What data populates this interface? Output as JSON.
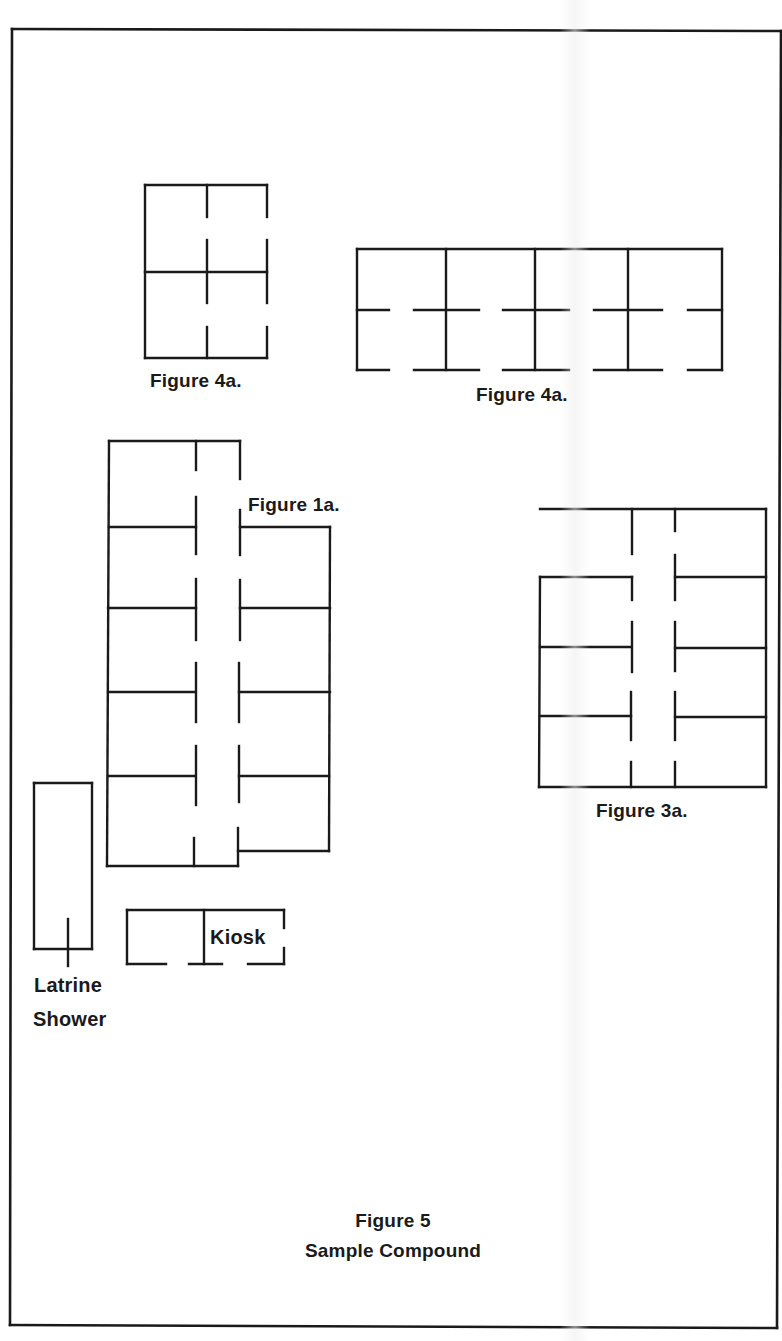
{
  "page": {
    "caption_title": "Figure 5",
    "caption_subtitle": "Sample Compound"
  },
  "colors": {
    "ink": "#1a1a1a",
    "paper": "#ffffff"
  },
  "labels": {
    "fig4a_left": "Figure 4a.",
    "fig4a_right": "Figure 4a.",
    "fig1a": "Figure 1a.",
    "fig3a": "Figure 3a.",
    "kiosk": "Kiosk",
    "latrine": "Latrine",
    "shower": "Shower"
  },
  "diagram": {
    "frame": [
      [
        12,
        29,
        781,
        31
      ],
      [
        781,
        31,
        777,
        1328
      ],
      [
        777,
        1328,
        10,
        1325
      ],
      [
        10,
        1325,
        12,
        29
      ]
    ],
    "figure_4a_left": [
      [
        145,
        185,
        267,
        185
      ],
      [
        145,
        185,
        145,
        358
      ],
      [
        145,
        358,
        267,
        358
      ],
      [
        145,
        272,
        267,
        272
      ],
      [
        207,
        185,
        207,
        217
      ],
      [
        207,
        240,
        207,
        303
      ],
      [
        207,
        327,
        207,
        358
      ],
      [
        267,
        185,
        267,
        217
      ],
      [
        267,
        240,
        267,
        303
      ],
      [
        267,
        327,
        267,
        358
      ]
    ],
    "figure_4a_right": [
      [
        357,
        249,
        722,
        249
      ],
      [
        357,
        249,
        357,
        370
      ],
      [
        722,
        249,
        722,
        370
      ],
      [
        446,
        249,
        446,
        370
      ],
      [
        535,
        249,
        535,
        370
      ],
      [
        628,
        249,
        628,
        370
      ],
      [
        357,
        310,
        389,
        310
      ],
      [
        414,
        310,
        479,
        310
      ],
      [
        503,
        310,
        569,
        310
      ],
      [
        594,
        310,
        662,
        310
      ],
      [
        688,
        310,
        722,
        310
      ],
      [
        357,
        370,
        389,
        370
      ],
      [
        414,
        370,
        479,
        370
      ],
      [
        503,
        370,
        569,
        370
      ],
      [
        594,
        370,
        662,
        370
      ],
      [
        688,
        370,
        722,
        370
      ]
    ],
    "figure_1a": [
      [
        109,
        441,
        240,
        441
      ],
      [
        109,
        441,
        107,
        866
      ],
      [
        107,
        866,
        238,
        866
      ],
      [
        196,
        441,
        196,
        470
      ],
      [
        196,
        497,
        196,
        554
      ],
      [
        196,
        579,
        196,
        640
      ],
      [
        196,
        663,
        196,
        722
      ],
      [
        196,
        746,
        196,
        805
      ],
      [
        194,
        838,
        194,
        866
      ],
      [
        240,
        441,
        240,
        479
      ],
      [
        240,
        510,
        240,
        555
      ],
      [
        240,
        580,
        240,
        640
      ],
      [
        239,
        663,
        239,
        722
      ],
      [
        239,
        746,
        239,
        802
      ],
      [
        238,
        828,
        238,
        866
      ],
      [
        109,
        527,
        196,
        527
      ],
      [
        108,
        608,
        196,
        608
      ],
      [
        108,
        692,
        195,
        692
      ],
      [
        108,
        776,
        195,
        776
      ],
      [
        240,
        527,
        330,
        527
      ],
      [
        330,
        527,
        329,
        851
      ],
      [
        238,
        851,
        329,
        851
      ],
      [
        240,
        608,
        330,
        608
      ],
      [
        239,
        692,
        330,
        692
      ],
      [
        239,
        776,
        329,
        776
      ]
    ],
    "figure_3a": [
      [
        540,
        509,
        766,
        509
      ],
      [
        766,
        509,
        766,
        787
      ],
      [
        539,
        787,
        766,
        787
      ],
      [
        540,
        577,
        632,
        577
      ],
      [
        540,
        577,
        539,
        787
      ],
      [
        632,
        509,
        632,
        554
      ],
      [
        632,
        577,
        632,
        600
      ],
      [
        632,
        622,
        632,
        672
      ],
      [
        631,
        692,
        631,
        740
      ],
      [
        631,
        762,
        631,
        787
      ],
      [
        675,
        509,
        675,
        531
      ],
      [
        675,
        555,
        675,
        600
      ],
      [
        675,
        622,
        675,
        671
      ],
      [
        675,
        692,
        675,
        740
      ],
      [
        675,
        762,
        675,
        787
      ],
      [
        540,
        647,
        631,
        647
      ],
      [
        540,
        716,
        631,
        716
      ],
      [
        675,
        577,
        766,
        577
      ],
      [
        675,
        648,
        766,
        648
      ],
      [
        675,
        717,
        766,
        717
      ]
    ],
    "latrine": [
      [
        34,
        783,
        92,
        783
      ],
      [
        92,
        783,
        92,
        949
      ],
      [
        92,
        949,
        34,
        949
      ],
      [
        34,
        949,
        34,
        783
      ],
      [
        68,
        919,
        68,
        966
      ]
    ],
    "kiosk": [
      [
        127,
        910,
        284,
        910
      ],
      [
        127,
        910,
        127,
        964
      ],
      [
        204,
        910,
        204,
        964
      ],
      [
        284,
        910,
        284,
        928
      ],
      [
        284,
        948,
        284,
        964
      ],
      [
        127,
        964,
        166,
        964
      ],
      [
        189,
        964,
        222,
        964
      ],
      [
        248,
        964,
        284,
        964
      ]
    ]
  }
}
